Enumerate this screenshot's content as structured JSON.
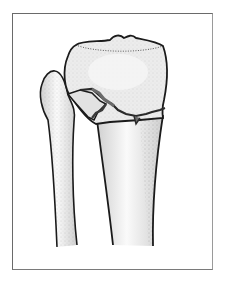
{
  "figure": {
    "bones": [
      "tibia",
      "fibula"
    ],
    "colors": {
      "outline": "#1a1a1a",
      "bone_fill": "#e6e6e6",
      "bone_highlight": "#f7f7f7",
      "stipple": "#555555",
      "fracture_fill": "#6b6b6b",
      "frame": "#6a6a6a",
      "background": "#ffffff"
    }
  }
}
